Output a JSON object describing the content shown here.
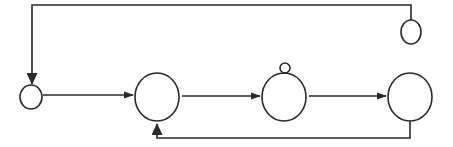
{
  "diagram": {
    "type": "flow-diagram",
    "colors": {
      "stroke": "#2a2a2a",
      "background": "#ffffff"
    },
    "nodes": [
      {
        "id": "n1",
        "label": "",
        "shape": "circle",
        "size": "small",
        "cx": 31,
        "cy": 97,
        "rx": 11,
        "ry": 12
      },
      {
        "id": "n2",
        "label": "",
        "shape": "circle",
        "size": "large",
        "cx": 157,
        "cy": 97,
        "rx": 22,
        "ry": 24
      },
      {
        "id": "n3",
        "label": "",
        "shape": "circle",
        "size": "large",
        "cx": 284,
        "cy": 97,
        "rx": 22,
        "ry": 24
      },
      {
        "id": "n3-knob",
        "label": "",
        "shape": "circle",
        "size": "tiny",
        "cx": 285,
        "cy": 68,
        "rx": 5,
        "ry": 5
      },
      {
        "id": "n4",
        "label": "",
        "shape": "circle",
        "size": "large",
        "cx": 410,
        "cy": 97,
        "rx": 22,
        "ry": 24
      },
      {
        "id": "n5",
        "label": "",
        "shape": "circle",
        "size": "small",
        "cx": 411,
        "cy": 32,
        "rx": 10,
        "ry": 12
      }
    ],
    "edges": [
      {
        "from": "n1",
        "to": "n2",
        "direction": "forward"
      },
      {
        "from": "n2",
        "to": "n3",
        "direction": "forward"
      },
      {
        "from": "n3",
        "to": "n4",
        "direction": "forward"
      },
      {
        "from": "n4",
        "to": "n2",
        "direction": "feedback-below"
      },
      {
        "from": "n5",
        "to": "n1",
        "direction": "feedback-above"
      }
    ]
  }
}
